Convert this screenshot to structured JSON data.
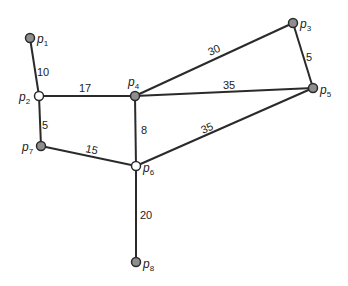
{
  "graph": {
    "nodes": [
      {
        "id": "p1",
        "label": "p",
        "sub": "1",
        "x": 30,
        "y": 38,
        "style": "filled"
      },
      {
        "id": "p2",
        "label": "p",
        "sub": "2",
        "x": 39,
        "y": 96,
        "style": "open"
      },
      {
        "id": "p3",
        "label": "p",
        "sub": "3",
        "x": 293,
        "y": 23,
        "style": "filled"
      },
      {
        "id": "p4",
        "label": "p",
        "sub": "4",
        "x": 135,
        "y": 96,
        "style": "filled"
      },
      {
        "id": "p5",
        "label": "p",
        "sub": "5",
        "x": 313,
        "y": 88,
        "style": "filled"
      },
      {
        "id": "p6",
        "label": "p",
        "sub": "6",
        "x": 136,
        "y": 166,
        "style": "open"
      },
      {
        "id": "p7",
        "label": "p",
        "sub": "7",
        "x": 41,
        "y": 146,
        "style": "filled"
      },
      {
        "id": "p8",
        "label": "p",
        "sub": "8",
        "x": 136,
        "y": 262,
        "style": "filled"
      }
    ],
    "edges": [
      {
        "from": "p1",
        "to": "p2",
        "weight": "10"
      },
      {
        "from": "p2",
        "to": "p4",
        "weight": "17"
      },
      {
        "from": "p2",
        "to": "p7",
        "weight": "5"
      },
      {
        "from": "p4",
        "to": "p3",
        "weight": "30"
      },
      {
        "from": "p4",
        "to": "p5",
        "weight": "35"
      },
      {
        "from": "p3",
        "to": "p5",
        "weight": "5"
      },
      {
        "from": "p4",
        "to": "p6",
        "weight": "8"
      },
      {
        "from": "p7",
        "to": "p6",
        "weight": "15"
      },
      {
        "from": "p6",
        "to": "p5",
        "weight": "35"
      },
      {
        "from": "p6",
        "to": "p8",
        "weight": "20"
      }
    ]
  }
}
